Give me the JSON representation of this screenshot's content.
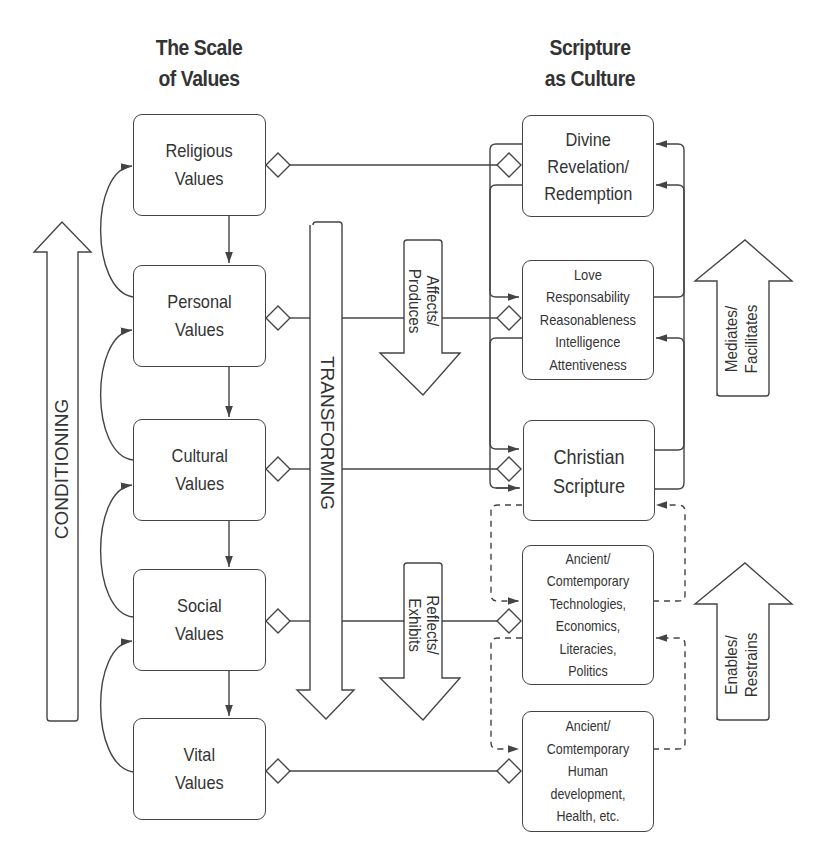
{
  "headings": {
    "left": [
      "The Scale",
      "of Values"
    ],
    "right": [
      "Scripture",
      "as Culture"
    ]
  },
  "scale_of_values": [
    {
      "id": "religious",
      "lines": [
        "Religious",
        "Values"
      ]
    },
    {
      "id": "personal",
      "lines": [
        "Personal",
        "Values"
      ]
    },
    {
      "id": "cultural",
      "lines": [
        "Cultural",
        "Values"
      ]
    },
    {
      "id": "social",
      "lines": [
        "Social",
        "Values"
      ]
    },
    {
      "id": "vital",
      "lines": [
        "Vital",
        "Values"
      ]
    }
  ],
  "scripture_as_culture": [
    {
      "id": "divine",
      "lines": [
        "Divine",
        "Revelation/",
        "Redemption"
      ]
    },
    {
      "id": "virtues",
      "lines": [
        "Love",
        "Responsability",
        "Reasonableness",
        "Intelligence",
        "Attentiveness"
      ]
    },
    {
      "id": "christian-scripture",
      "lines": [
        "Christian",
        "Scripture"
      ]
    },
    {
      "id": "technologies",
      "lines": [
        "Ancient/",
        "Comtemporary",
        "Technologies,",
        "Economics,",
        "Literacies,",
        "Politics"
      ]
    },
    {
      "id": "human-development",
      "lines": [
        "Ancient/",
        "Comtemporary",
        "Human",
        "development,",
        "Health, etc."
      ]
    }
  ],
  "arrows": {
    "conditioning": "CONDITIONING",
    "transforming": "TRANSFORMING",
    "affects_produces": [
      "Affects/",
      "Produces"
    ],
    "reflects_exhibits": [
      "Reflects/",
      "Exhibits"
    ],
    "mediates_facilitates": [
      "Mediates/",
      "Facilitates"
    ],
    "enables_restrains": [
      "Enables/",
      "Restrains"
    ]
  },
  "colors": {
    "stroke": "#444444",
    "text": "#333333",
    "background": "#ffffff"
  }
}
